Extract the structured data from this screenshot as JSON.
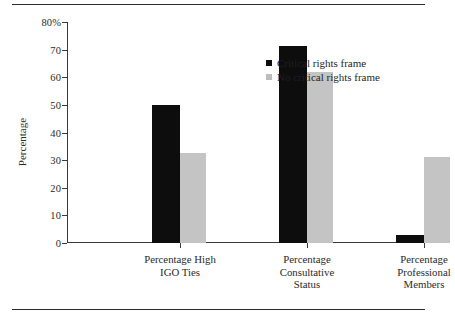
{
  "chart_data": {
    "type": "bar",
    "title": "",
    "subtitle": "",
    "xlabel": "",
    "ylabel": "Percentage",
    "ylim": [
      0,
      80
    ],
    "y_ticks": [
      0,
      10,
      20,
      30,
      40,
      50,
      60,
      70,
      80
    ],
    "y_tick_labels": [
      "0",
      "10",
      "20",
      "30",
      "40",
      "50",
      "60",
      "70",
      "80%"
    ],
    "grid": false,
    "legend_position": "upper right",
    "categories": [
      "Percentage High\nIGO Ties",
      "Percentage\nConsultative\nStatus",
      "Percentage\nProfessional\nMembers"
    ],
    "series": [
      {
        "name": "Critical rights frame",
        "color": "#0d0d0d",
        "values": [
          50.0,
          71.3,
          3.0
        ]
      },
      {
        "name": "No critical rights frame",
        "color": "#c4c4c4",
        "values": [
          32.5,
          62.0,
          31.0
        ]
      }
    ]
  },
  "legend": {
    "items": [
      {
        "label": "Critical rights frame",
        "swatch": "black-square-icon"
      },
      {
        "label": "No critical rights frame",
        "swatch": "gray-square-icon"
      }
    ]
  },
  "axis": {
    "y_title": "Percentage"
  }
}
